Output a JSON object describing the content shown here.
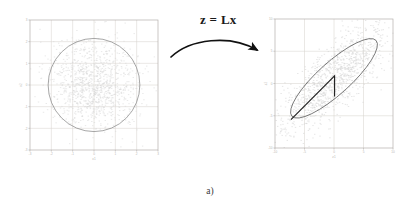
{
  "figure": {
    "caption": "a)",
    "transform_label": "z = Lx",
    "arrow": "curved-arrow-right"
  },
  "chart_data": [
    {
      "type": "scatter",
      "id": "left",
      "title": "",
      "xlabel": "x1",
      "ylabel": "x2",
      "xlim": [
        -3,
        3
      ],
      "ylim": [
        -3,
        3
      ],
      "xticks": [
        -3,
        -2,
        -1,
        0,
        1,
        2,
        3
      ],
      "yticks": [
        -3,
        -2,
        -1,
        0,
        1,
        2,
        3
      ],
      "xticklabels": [
        "-3",
        "-2",
        "-1",
        "0",
        "1",
        "2",
        "3"
      ],
      "yticklabels": [
        "-3",
        "-2",
        "-1",
        "0",
        "1",
        "2",
        "3"
      ],
      "grid": true,
      "legend": "none",
      "point_color": "#d9d9d9",
      "contour_color": "#8a8a8a",
      "description": "isotropic standard normal cloud with circular unit-covariance contour",
      "contours": [
        {
          "shape": "ellipse",
          "cx": 0.0,
          "cy": 0.0,
          "rx": 2.15,
          "ry": 2.15,
          "angle_deg": 0
        }
      ],
      "n_points": 1100,
      "distribution": {
        "mean": [
          0.0,
          0.0
        ],
        "cov": [
          [
            1.0,
            0.0
          ],
          [
            0.0,
            1.0
          ]
        ]
      }
    },
    {
      "type": "scatter",
      "id": "right",
      "title": "",
      "xlabel": "z1",
      "ylabel": "z2",
      "xlim": [
        -10,
        10
      ],
      "ylim": [
        -10,
        10
      ],
      "xticks": [
        -10,
        -5,
        0,
        5,
        10
      ],
      "yticks": [
        -10,
        -5,
        0,
        5,
        10
      ],
      "xticklabels": [
        "-10",
        "-5",
        "0",
        "5",
        "10"
      ],
      "yticklabels": [
        "-10",
        "-5",
        "0",
        "5",
        "10"
      ],
      "grid": true,
      "legend": "none",
      "point_color": "#d4d4d4",
      "contour_color": "#5a5a5a",
      "description": "correlated Gaussian cloud, elongated tilted ellipse contour with right-angle axis marker",
      "contours": [
        {
          "shape": "ellipse",
          "cx": 0.0,
          "cy": 0.8,
          "rx": 9.6,
          "ry": 2.5,
          "angle_deg": -42
        }
      ],
      "n_points": 1100,
      "distribution": {
        "mean": [
          0.0,
          0.8
        ],
        "cov": [
          [
            22.0,
            17.0
          ],
          [
            17.0,
            20.0
          ]
        ]
      },
      "annotations": [
        {
          "name": "right-angle-marker",
          "type": "polyline",
          "points": [
            [
              -7.3,
              -5.6
            ],
            [
              0.1,
              1.2
            ],
            [
              0.1,
              -2.0
            ]
          ],
          "color": "#1d1d1d",
          "width": 1.1
        }
      ]
    }
  ]
}
